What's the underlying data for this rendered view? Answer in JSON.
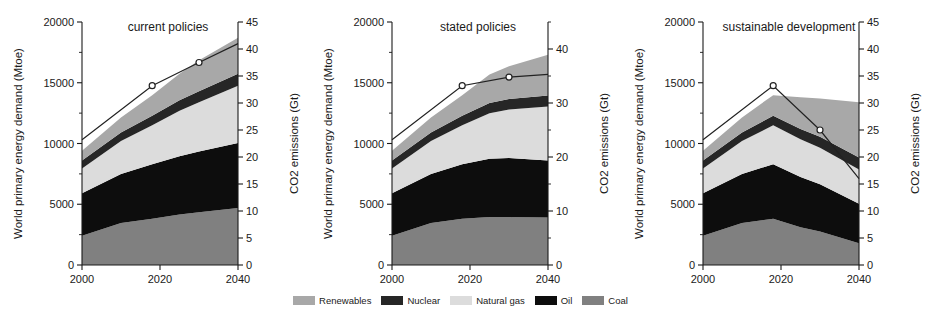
{
  "figure": {
    "width": 931,
    "height": 319,
    "background": "#ffffff"
  },
  "legend": {
    "items": [
      {
        "label": "Renewables",
        "color": "#a8a8a8"
      },
      {
        "label": "Nuclear",
        "color": "#262626"
      },
      {
        "label": "Natural gas",
        "color": "#dcdcdc"
      },
      {
        "label": "Oil",
        "color": "#0d0d0d"
      },
      {
        "label": "Coal",
        "color": "#808080"
      }
    ]
  },
  "chart_data": [
    {
      "type": "area",
      "title": "current policies",
      "xlabel": "",
      "ylabel": "World primary energy demand (Mtoe)",
      "y2label": "CO2 emissions (Gt)",
      "x": [
        2000,
        2010,
        2018,
        2025,
        2030,
        2040
      ],
      "xlim": [
        2000,
        2040
      ],
      "xticks": [
        2000,
        2020,
        2040
      ],
      "ylim": [
        0,
        20000
      ],
      "yticks": [
        0,
        5000,
        10000,
        15000,
        20000
      ],
      "yminorticks": [
        2500,
        7500,
        12500,
        17500
      ],
      "y2lim": [
        0,
        45
      ],
      "y2ticks": [
        0,
        5,
        10,
        15,
        20,
        25,
        30,
        35,
        40,
        45
      ],
      "grid": false,
      "legend_position": "bottom-center-shared",
      "stack_order_bottom_to_top": [
        "Coal",
        "Oil",
        "Natural gas",
        "Nuclear",
        "Renewables"
      ],
      "series": [
        {
          "name": "Coal",
          "color": "#808080",
          "values": [
            2400,
            3450,
            3800,
            4150,
            4350,
            4700
          ]
        },
        {
          "name": "Oil",
          "color": "#0d0d0d",
          "values": [
            3500,
            4050,
            4500,
            4800,
            5000,
            5350
          ]
        },
        {
          "name": "Natural gas",
          "color": "#dcdcdc",
          "values": [
            2050,
            2700,
            3200,
            3750,
            4050,
            4700
          ]
        },
        {
          "name": "Nuclear",
          "color": "#262626",
          "values": [
            650,
            700,
            780,
            850,
            900,
            1000
          ]
        },
        {
          "name": "Renewables",
          "color": "#a8a8a8",
          "values": [
            800,
            1250,
            1700,
            2200,
            2550,
            2950
          ]
        }
      ],
      "emissions_line": {
        "name": "CO2 emissions",
        "x": [
          2000,
          2018,
          2030,
          2040
        ],
        "values": [
          23.2,
          33.2,
          37.5,
          41.0
        ],
        "marker_x": [
          2018,
          2030
        ],
        "marker_values": [
          33.2,
          37.5
        ],
        "color": "#222222",
        "marker_face": "#ffffff"
      }
    },
    {
      "type": "area",
      "title": "stated policies",
      "xlabel": "",
      "ylabel": "World primary energy demand (Mtoe)",
      "y2label": "CO2 emissions (Gt)",
      "x": [
        2000,
        2010,
        2018,
        2025,
        2030,
        2040
      ],
      "xlim": [
        2000,
        2040
      ],
      "xticks": [
        2000,
        2020,
        2040
      ],
      "ylim": [
        0,
        20000
      ],
      "yticks": [
        0,
        5000,
        10000,
        15000,
        20000
      ],
      "yminorticks": [
        2500,
        7500,
        12500,
        17500
      ],
      "y2lim": [
        0,
        45
      ],
      "y2ticks": [
        0,
        10,
        20,
        30,
        40
      ],
      "y2minorticks": [
        5,
        15,
        25,
        35,
        45
      ],
      "grid": false,
      "legend_position": "bottom-center-shared",
      "stack_order_bottom_to_top": [
        "Coal",
        "Oil",
        "Natural gas",
        "Nuclear",
        "Renewables"
      ],
      "series": [
        {
          "name": "Coal",
          "color": "#808080",
          "values": [
            2400,
            3450,
            3800,
            3950,
            3950,
            3900
          ]
        },
        {
          "name": "Oil",
          "color": "#0d0d0d",
          "values": [
            3500,
            4050,
            4500,
            4800,
            4850,
            4700
          ]
        },
        {
          "name": "Natural gas",
          "color": "#dcdcdc",
          "values": [
            2050,
            2700,
            3200,
            3750,
            4000,
            4450
          ]
        },
        {
          "name": "Nuclear",
          "color": "#262626",
          "values": [
            650,
            700,
            780,
            830,
            860,
            900
          ]
        },
        {
          "name": "Renewables",
          "color": "#a8a8a8",
          "values": [
            800,
            1250,
            1700,
            2350,
            2700,
            3350
          ]
        }
      ],
      "emissions_line": {
        "name": "CO2 emissions",
        "x": [
          2000,
          2018,
          2030,
          2040
        ],
        "values": [
          23.2,
          33.2,
          34.8,
          35.3
        ],
        "marker_x": [
          2018,
          2030
        ],
        "marker_values": [
          33.2,
          34.8
        ],
        "color": "#222222",
        "marker_face": "#ffffff"
      }
    },
    {
      "type": "area",
      "title": "sustainable development",
      "xlabel": "",
      "ylabel": "World primary energy demand (Mtoe)",
      "y2label": "CO2 emissions (Gt)",
      "x": [
        2000,
        2010,
        2018,
        2025,
        2030,
        2040
      ],
      "xlim": [
        2000,
        2040
      ],
      "xticks": [
        2000,
        2020,
        2040
      ],
      "ylim": [
        0,
        20000
      ],
      "yticks": [
        0,
        5000,
        10000,
        15000,
        20000
      ],
      "yminorticks": [
        2500,
        7500,
        12500,
        17500
      ],
      "y2lim": [
        0,
        45
      ],
      "y2ticks": [
        0,
        5,
        10,
        15,
        20,
        25,
        30,
        35,
        40,
        45
      ],
      "grid": false,
      "legend_position": "bottom-center-shared",
      "stack_order_bottom_to_top": [
        "Coal",
        "Oil",
        "Natural gas",
        "Nuclear",
        "Renewables"
      ],
      "series": [
        {
          "name": "Coal",
          "color": "#808080",
          "values": [
            2400,
            3450,
            3800,
            3100,
            2750,
            1800
          ]
        },
        {
          "name": "Oil",
          "color": "#0d0d0d",
          "values": [
            3500,
            4050,
            4500,
            4150,
            3900,
            3250
          ]
        },
        {
          "name": "Natural gas",
          "color": "#dcdcdc",
          "values": [
            2050,
            2700,
            3200,
            3100,
            3000,
            2800
          ]
        },
        {
          "name": "Nuclear",
          "color": "#262626",
          "values": [
            650,
            700,
            780,
            850,
            900,
            1000
          ]
        },
        {
          "name": "Renewables",
          "color": "#a8a8a8",
          "values": [
            800,
            1250,
            1700,
            2600,
            3150,
            4550
          ]
        }
      ],
      "emissions_line": {
        "name": "CO2 emissions",
        "x": [
          2000,
          2018,
          2030,
          2040
        ],
        "values": [
          23.2,
          33.2,
          25.0,
          16.0
        ],
        "marker_x": [
          2018,
          2030
        ],
        "marker_values": [
          33.2,
          25.0
        ],
        "color": "#222222",
        "marker_face": "#ffffff"
      }
    }
  ]
}
